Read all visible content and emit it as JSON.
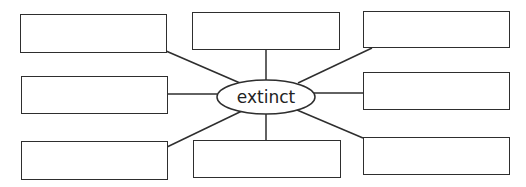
{
  "diagram": {
    "type": "word-web",
    "center": {
      "label": "extinct"
    },
    "boxes": [
      {
        "position": "top-left",
        "text": ""
      },
      {
        "position": "top-center",
        "text": ""
      },
      {
        "position": "top-right",
        "text": ""
      },
      {
        "position": "middle-left",
        "text": ""
      },
      {
        "position": "middle-right",
        "text": ""
      },
      {
        "position": "bottom-left",
        "text": ""
      },
      {
        "position": "bottom-center",
        "text": ""
      },
      {
        "position": "bottom-right",
        "text": ""
      }
    ],
    "colors": {
      "stroke": "#2e2e2e",
      "background": "#ffffff",
      "text": "#222222"
    }
  }
}
